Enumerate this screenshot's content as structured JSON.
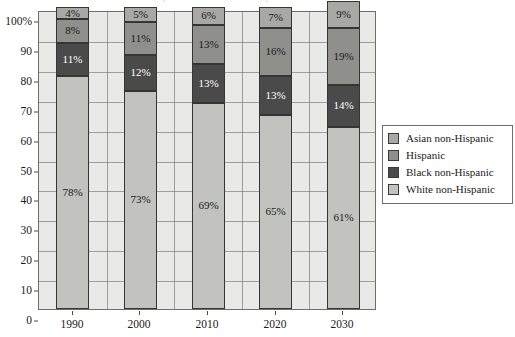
{
  "chart_data": {
    "type": "bar",
    "stacked": true,
    "stacked_mode": "percent",
    "title": "Projected Race and Ethnicity of the U.S. Population",
    "xlabel": "",
    "ylabel": "",
    "ylim": [
      0,
      100
    ],
    "grid": true,
    "legend_position": "right",
    "categories": [
      "1990",
      "2000",
      "2010",
      "2020",
      "2030"
    ],
    "ytick_labels": [
      "0",
      "10",
      "20",
      "30",
      "40",
      "50",
      "60",
      "70",
      "80",
      "90",
      "100%"
    ],
    "ytick_values": [
      0,
      10,
      20,
      30,
      40,
      50,
      60,
      70,
      80,
      90,
      100
    ],
    "series": [
      {
        "name": "White non-Hispanic",
        "color": "#c2c2bf",
        "label_color": "dark",
        "values": [
          78,
          73,
          69,
          65,
          61
        ],
        "labels": [
          "78%",
          "73%",
          "69%",
          "65%",
          "61%"
        ]
      },
      {
        "name": "Black non-Hispanic",
        "color": "#4a4a4a",
        "label_color": "light",
        "values": [
          11,
          12,
          13,
          13,
          14
        ],
        "labels": [
          "11%",
          "12%",
          "13%",
          "13%",
          "14%"
        ]
      },
      {
        "name": "Hispanic",
        "color": "#8f8f8c",
        "label_color": "dark",
        "values": [
          8,
          11,
          13,
          16,
          19
        ],
        "labels": [
          "8%",
          "11%",
          "13%",
          "16%",
          "19%"
        ]
      },
      {
        "name": "Asian non-Hispanic",
        "color": "#a8a8a5",
        "label_color": "dark",
        "values": [
          4,
          5,
          6,
          7,
          9
        ],
        "labels": [
          "4%",
          "5%",
          "6%",
          "7%",
          "9%"
        ]
      }
    ],
    "legend_entries": [
      {
        "label": "Asian non-Hispanic",
        "color": "#a8a8a5"
      },
      {
        "label": "Hispanic",
        "color": "#8f8f8c"
      },
      {
        "label": "Black non-Hispanic",
        "color": "#4a4a4a"
      },
      {
        "label": "White non-Hispanic",
        "color": "#c2c2bf"
      }
    ],
    "plot_background": "#e9e9e7",
    "axis_color": "#6d6d6d"
  }
}
